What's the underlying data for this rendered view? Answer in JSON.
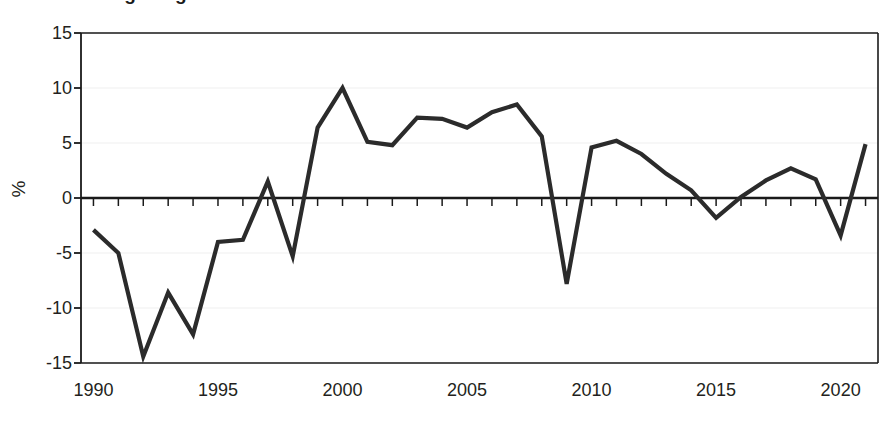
{
  "title": "Annual change in gross value added",
  "axis": {
    "ylabel": "%",
    "xlabel": "",
    "yticks": [
      15,
      10,
      5,
      0,
      -5,
      -10,
      -15
    ],
    "ytick_labels": [
      "15",
      "10",
      "5",
      "0",
      "-5",
      "-10",
      "-15"
    ],
    "xticks": [
      1990,
      1995,
      2000,
      2005,
      2010,
      2015,
      2020
    ],
    "xtick_labels": [
      "1990",
      "1995",
      "2000",
      "2005",
      "2010",
      "2015",
      "2020"
    ]
  },
  "colors": {
    "line": "#2b2b2b",
    "axis": "#1a1a1a",
    "grid": "#efefef",
    "background": "#ffffff",
    "text": "#231f20"
  },
  "chart_data": {
    "type": "line",
    "title": "Annual change in gross value added",
    "xlabel": "",
    "ylabel": "%",
    "xlim": [
      1989.5,
      2021.5
    ],
    "ylim": [
      -15,
      15
    ],
    "grid": true,
    "legend": null,
    "x": [
      1990,
      1991,
      1992,
      1993,
      1994,
      1995,
      1996,
      1997,
      1998,
      1999,
      2000,
      2001,
      2002,
      2003,
      2004,
      2005,
      2006,
      2007,
      2008,
      2009,
      2010,
      2011,
      2012,
      2013,
      2014,
      2015,
      2016,
      2017,
      2018,
      2019,
      2020,
      2021
    ],
    "values": [
      -2.9,
      -5.0,
      -14.4,
      -8.6,
      -12.4,
      -4.0,
      -3.8,
      1.5,
      -5.3,
      6.4,
      10.0,
      5.1,
      4.8,
      7.3,
      7.2,
      6.4,
      7.8,
      8.5,
      5.6,
      -7.8,
      4.6,
      5.2,
      4.0,
      2.2,
      0.7,
      -1.8,
      0.1,
      1.6,
      2.7,
      1.7,
      -3.4,
      4.9
    ],
    "series": [
      {
        "name": "Annual change",
        "values": [
          -2.9,
          -5.0,
          -14.4,
          -8.6,
          -12.4,
          -4.0,
          -3.8,
          1.5,
          -5.3,
          6.4,
          10.0,
          5.1,
          4.8,
          7.3,
          7.2,
          6.4,
          7.8,
          8.5,
          5.6,
          -7.8,
          4.6,
          5.2,
          4.0,
          2.2,
          0.7,
          -1.8,
          0.1,
          1.6,
          2.7,
          1.7,
          -3.4,
          4.9
        ]
      }
    ]
  }
}
